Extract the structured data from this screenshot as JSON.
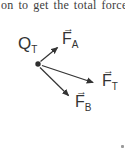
{
  "caption": {
    "text": "on to get the total force F"
  },
  "diagram": {
    "charge": {
      "symbol": "Q",
      "subscript": "T"
    },
    "vectors": {
      "fa": {
        "symbol": "F",
        "subscript": "A"
      },
      "ft": {
        "symbol": "F",
        "subscript": "T"
      },
      "fb": {
        "symbol": "F",
        "subscript": "B"
      }
    },
    "vector_arrow_glyph": "→",
    "colors": {
      "ink": "#333333",
      "background": "#ffffff"
    }
  }
}
